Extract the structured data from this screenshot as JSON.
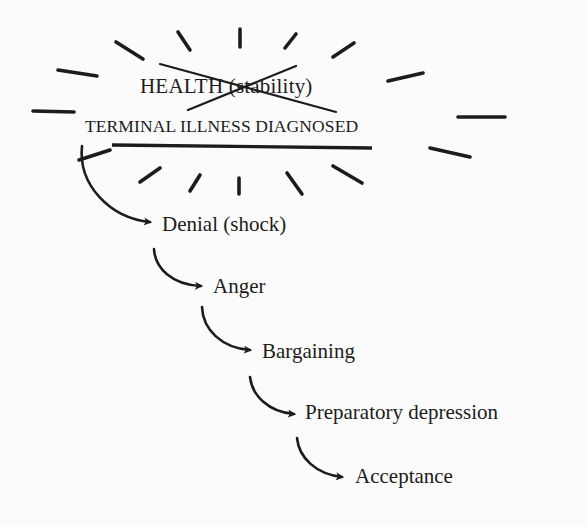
{
  "diagram": {
    "type": "stage-flow",
    "colors": {
      "ink": "#1c1c1c",
      "background": "#fbfbfb"
    },
    "origin": {
      "crossed_out_label": "HEALTH (stability)",
      "event_label": "TERMINAL ILLNESS DIAGNOSED",
      "decoration": "burst-rays"
    },
    "stages": [
      {
        "label": "Denial (shock)"
      },
      {
        "label": "Anger"
      },
      {
        "label": "Bargaining"
      },
      {
        "label": "Preparatory depression"
      },
      {
        "label": "Acceptance"
      }
    ]
  }
}
